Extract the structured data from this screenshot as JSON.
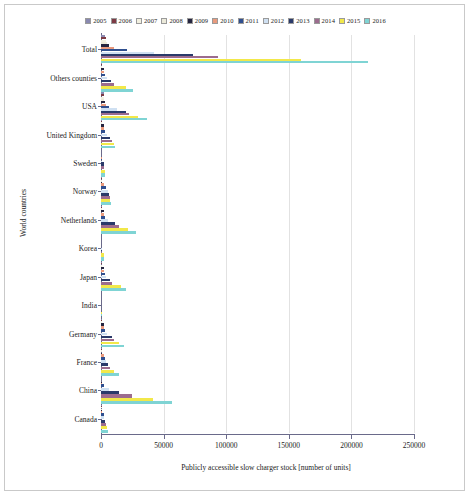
{
  "axis": {
    "xlabel": "Publicly accessible slow charger stock [number of units]",
    "ylabel": "World countries",
    "xticks": [
      "0",
      "50000",
      "100000",
      "150000",
      "200000",
      "250000"
    ]
  },
  "chart_data": {
    "type": "bar",
    "orientation": "horizontal",
    "title": "",
    "xlabel": "Publicly accessible slow charger stock [number of units]",
    "ylabel": "World countries",
    "xlim": [
      0,
      250000
    ],
    "xticks": [
      0,
      50000,
      100000,
      150000,
      200000,
      250000
    ],
    "grid": true,
    "legend_position": "top",
    "categories": [
      "Total",
      "Others counties",
      "USA",
      "United Kingdom",
      "Sweden",
      "Norway",
      "Netherlands",
      "Korea",
      "Japan",
      "India",
      "Germany",
      "France",
      "China",
      "Canada"
    ],
    "series": [
      {
        "name": "2005",
        "color": "#8989b0",
        "values": [
          1900,
          100,
          600,
          100,
          20,
          100,
          100,
          0,
          200,
          0,
          100,
          100,
          0,
          100
        ]
      },
      {
        "name": "2006",
        "color": "#7d3a44",
        "values": [
          2200,
          150,
          700,
          150,
          25,
          150,
          150,
          0,
          250,
          0,
          150,
          150,
          0,
          120
        ]
      },
      {
        "name": "2007",
        "color": "#f2f0e0",
        "values": [
          2600,
          200,
          800,
          200,
          30,
          200,
          200,
          0,
          300,
          0,
          200,
          200,
          0,
          150
        ]
      },
      {
        "name": "2008",
        "color": "#eceada",
        "values": [
          3200,
          300,
          1000,
          300,
          40,
          250,
          300,
          0,
          350,
          0,
          300,
          250,
          0,
          180
        ]
      },
      {
        "name": "2009",
        "color": "#25253f",
        "values": [
          5000,
          500,
          1500,
          500,
          60,
          400,
          500,
          10,
          500,
          0,
          500,
          400,
          100,
          220
        ]
      },
      {
        "name": "2010",
        "color": "#e99a7d",
        "values": [
          9000,
          900,
          2500,
          900,
          100,
          800,
          900,
          20,
          800,
          0,
          900,
          700,
          300,
          300
        ]
      },
      {
        "name": "2011",
        "color": "#2f4f8f",
        "values": [
          19000,
          1800,
          5000,
          1800,
          200,
          2600,
          1800,
          50,
          1500,
          10,
          1800,
          1400,
          900,
          500
        ]
      },
      {
        "name": "2012",
        "color": "#cfe0f2",
        "values": [
          41000,
          3500,
          11000,
          3500,
          400,
          3800,
          4200,
          100,
          2600,
          20,
          3500,
          2400,
          5000,
          800
        ]
      },
      {
        "name": "2013",
        "color": "#2a3a6a",
        "values": [
          72000,
          6500,
          18000,
          5500,
          700,
          4600,
          9500,
          200,
          5500,
          40,
          7000,
          4000,
          13000,
          1400
        ]
      },
      {
        "name": "2014",
        "color": "#9c6c8e",
        "values": [
          92000,
          9000,
          21000,
          7000,
          900,
          5200,
          13000,
          300,
          7000,
          60,
          9000,
          5500,
          23000,
          2000
        ]
      },
      {
        "name": "2015",
        "color": "#f2e84a",
        "values": [
          158000,
          18000,
          28000,
          8500,
          1200,
          5800,
          20000,
          500,
          14000,
          100,
          13000,
          9000,
          40000,
          3000
        ]
      },
      {
        "name": "2016",
        "color": "#7fd4d4",
        "values": [
          212000,
          24000,
          35000,
          9500,
          1500,
          6500,
          26000,
          700,
          18000,
          150,
          17000,
          13000,
          55000,
          4000
        ]
      }
    ]
  }
}
